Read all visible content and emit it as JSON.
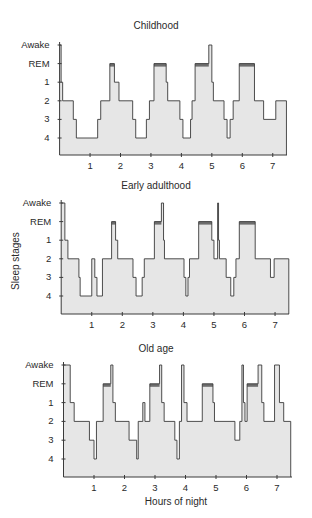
{
  "figure": {
    "ylabel": "Sleep stages",
    "xlabel": "Hours of night",
    "colors": {
      "fill": "#e6e6e6",
      "line": "#3a3a3a",
      "rem_band": "#6d6d6d"
    }
  },
  "chart_data": [
    {
      "type": "area",
      "title": "Childhood",
      "xlabel": "",
      "ylabel": "",
      "y_categories": [
        "Awake",
        "REM",
        "1",
        "2",
        "3",
        "4"
      ],
      "x_ticks": [
        "1",
        "2",
        "3",
        "4",
        "5",
        "6",
        "7"
      ],
      "xlim": [
        0,
        7.45
      ],
      "segments": [
        [
          0.0,
          0.05,
          "Awake"
        ],
        [
          0.05,
          0.1,
          "1"
        ],
        [
          0.1,
          0.45,
          "2"
        ],
        [
          0.45,
          0.55,
          "3"
        ],
        [
          0.55,
          1.25,
          "4"
        ],
        [
          1.25,
          1.35,
          "3"
        ],
        [
          1.35,
          1.65,
          "2"
        ],
        [
          1.65,
          1.8,
          "REM"
        ],
        [
          1.8,
          1.95,
          "1"
        ],
        [
          1.95,
          2.4,
          "2"
        ],
        [
          2.4,
          2.5,
          "3"
        ],
        [
          2.5,
          2.85,
          "4"
        ],
        [
          2.85,
          2.95,
          "3"
        ],
        [
          2.95,
          3.1,
          "2"
        ],
        [
          3.1,
          3.5,
          "REM"
        ],
        [
          3.5,
          3.55,
          "1"
        ],
        [
          3.55,
          3.95,
          "2"
        ],
        [
          3.95,
          4.05,
          "3"
        ],
        [
          4.05,
          4.3,
          "4"
        ],
        [
          4.3,
          4.35,
          "3"
        ],
        [
          4.35,
          4.45,
          "2"
        ],
        [
          4.45,
          4.9,
          "REM"
        ],
        [
          4.9,
          5.0,
          "Awake"
        ],
        [
          5.0,
          5.05,
          "1"
        ],
        [
          5.05,
          5.4,
          "2"
        ],
        [
          5.4,
          5.5,
          "3"
        ],
        [
          5.5,
          5.6,
          "4"
        ],
        [
          5.6,
          5.7,
          "3"
        ],
        [
          5.7,
          5.9,
          "2"
        ],
        [
          5.9,
          6.4,
          "REM"
        ],
        [
          6.4,
          6.7,
          "2"
        ],
        [
          6.7,
          7.1,
          "3"
        ],
        [
          7.1,
          7.45,
          "2"
        ]
      ]
    },
    {
      "type": "area",
      "title": "Early adulthood",
      "xlabel": "",
      "ylabel": "Sleep stages",
      "y_categories": [
        "Awake",
        "REM",
        "1",
        "2",
        "3",
        "4"
      ],
      "x_ticks": [
        "1",
        "2",
        "3",
        "4",
        "5",
        "6",
        "7"
      ],
      "xlim": [
        0,
        7.45
      ],
      "segments": [
        [
          0.0,
          0.12,
          "Awake"
        ],
        [
          0.12,
          0.22,
          "1"
        ],
        [
          0.22,
          0.58,
          "2"
        ],
        [
          0.58,
          0.62,
          "3"
        ],
        [
          0.62,
          1.0,
          "4"
        ],
        [
          1.0,
          1.1,
          "2"
        ],
        [
          1.1,
          1.17,
          "3"
        ],
        [
          1.17,
          1.35,
          "4"
        ],
        [
          1.35,
          1.65,
          "2"
        ],
        [
          1.65,
          1.78,
          "REM"
        ],
        [
          1.78,
          1.85,
          "1"
        ],
        [
          1.85,
          2.35,
          "2"
        ],
        [
          2.35,
          2.45,
          "3"
        ],
        [
          2.45,
          2.65,
          "4"
        ],
        [
          2.65,
          2.72,
          "3"
        ],
        [
          2.72,
          3.05,
          "2"
        ],
        [
          3.05,
          3.28,
          "REM"
        ],
        [
          3.28,
          3.35,
          "Awake"
        ],
        [
          3.35,
          3.38,
          "1"
        ],
        [
          3.38,
          4.02,
          "2"
        ],
        [
          4.02,
          4.08,
          "3"
        ],
        [
          4.08,
          4.15,
          "4"
        ],
        [
          4.15,
          4.2,
          "3"
        ],
        [
          4.2,
          4.5,
          "2"
        ],
        [
          4.5,
          4.93,
          "REM"
        ],
        [
          4.93,
          5.0,
          "1"
        ],
        [
          5.0,
          5.12,
          "2"
        ],
        [
          5.12,
          5.15,
          "Awake"
        ],
        [
          5.15,
          5.18,
          "1"
        ],
        [
          5.18,
          5.4,
          "2"
        ],
        [
          5.4,
          5.55,
          "3"
        ],
        [
          5.55,
          5.65,
          "4"
        ],
        [
          5.65,
          5.72,
          "3"
        ],
        [
          5.72,
          5.83,
          "2"
        ],
        [
          5.83,
          6.35,
          "REM"
        ],
        [
          6.35,
          6.85,
          "2"
        ],
        [
          6.85,
          6.97,
          "3"
        ],
        [
          6.97,
          7.45,
          "2"
        ]
      ]
    },
    {
      "type": "area",
      "title": "Old age",
      "xlabel": "Hours of night",
      "ylabel": "",
      "y_categories": [
        "Awake",
        "REM",
        "1",
        "2",
        "3",
        "4"
      ],
      "x_ticks": [
        "1",
        "2",
        "3",
        "4",
        "5",
        "6",
        "7"
      ],
      "xlim": [
        0,
        7.45
      ],
      "segments": [
        [
          0.0,
          0.22,
          "Awake"
        ],
        [
          0.22,
          0.35,
          "1"
        ],
        [
          0.35,
          0.85,
          "2"
        ],
        [
          0.85,
          1.0,
          "3"
        ],
        [
          1.0,
          1.08,
          "4"
        ],
        [
          1.08,
          1.3,
          "2"
        ],
        [
          1.3,
          1.55,
          "REM"
        ],
        [
          1.55,
          1.62,
          "Awake"
        ],
        [
          1.62,
          1.7,
          "1"
        ],
        [
          1.7,
          2.15,
          "2"
        ],
        [
          2.15,
          2.4,
          "3"
        ],
        [
          2.4,
          2.45,
          "4"
        ],
        [
          2.45,
          2.6,
          "2"
        ],
        [
          2.6,
          2.67,
          "1"
        ],
        [
          2.67,
          2.83,
          "2"
        ],
        [
          2.83,
          3.15,
          "REM"
        ],
        [
          3.15,
          3.22,
          "Awake"
        ],
        [
          3.22,
          3.3,
          "1"
        ],
        [
          3.3,
          3.65,
          "2"
        ],
        [
          3.65,
          3.72,
          "3"
        ],
        [
          3.72,
          3.8,
          "4"
        ],
        [
          3.8,
          3.87,
          "2"
        ],
        [
          3.87,
          3.95,
          "Awake"
        ],
        [
          3.95,
          4.05,
          "1"
        ],
        [
          4.05,
          4.55,
          "2"
        ],
        [
          4.55,
          4.9,
          "REM"
        ],
        [
          4.9,
          4.95,
          "1"
        ],
        [
          4.95,
          5.62,
          "2"
        ],
        [
          5.62,
          5.78,
          "3"
        ],
        [
          5.78,
          5.85,
          "2"
        ],
        [
          5.85,
          5.9,
          "Awake"
        ],
        [
          5.9,
          5.95,
          "1"
        ],
        [
          5.95,
          6.02,
          "2"
        ],
        [
          6.02,
          6.38,
          "REM"
        ],
        [
          6.38,
          6.5,
          "Awake"
        ],
        [
          6.5,
          6.57,
          "1"
        ],
        [
          6.57,
          6.92,
          "2"
        ],
        [
          6.92,
          7.08,
          "Awake"
        ],
        [
          7.08,
          7.22,
          "1"
        ],
        [
          7.22,
          7.45,
          "2"
        ]
      ]
    }
  ]
}
